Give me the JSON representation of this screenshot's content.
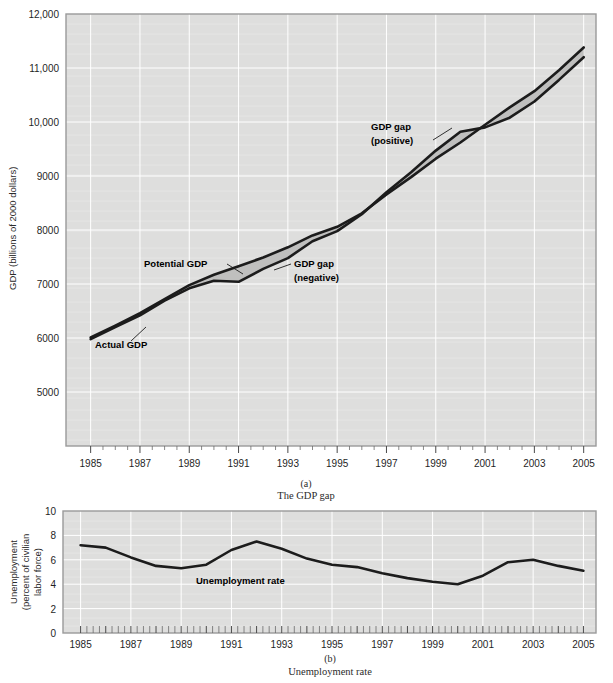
{
  "figure": {
    "panel_a": {
      "caption_letter": "(a)",
      "caption_text": "The GDP gap",
      "ylabel": "GDP (billions of 2000 dollars)",
      "annotations": {
        "actual": "Actual GDP",
        "potential": "Potential GDP",
        "gap_negative_line1": "GDP gap",
        "gap_negative_line2": "(negative)",
        "gap_positive_line1": "GDP gap",
        "gap_positive_line2": "(positive)"
      }
    },
    "panel_b": {
      "caption_letter": "(b)",
      "caption_text": "Unemployment rate",
      "ylabel_line1": "Unemployment",
      "ylabel_line2": "(percent of civilian",
      "ylabel_line3": "labor force)",
      "annotations": {
        "series": "Unemployment rate"
      }
    },
    "colors": {
      "plot_background": "#dededd",
      "gridline": "#ffffff",
      "series_line": "#1c1c1c",
      "gap_fill": "#bfbfbe",
      "border": "#9a9a9a"
    }
  },
  "chart_data": [
    {
      "type": "area",
      "title": "The GDP gap",
      "xlabel": "",
      "ylabel": "GDP (billions of 2000 dollars)",
      "xlim": [
        1984.0,
        2005.5
      ],
      "ylim": [
        4000,
        12000
      ],
      "ytick_labels": [
        "12,000",
        "11,000",
        "10,000",
        "9000",
        "8000",
        "7000",
        "6000",
        "5000"
      ],
      "yticks": [
        12000,
        11000,
        10000,
        9000,
        8000,
        7000,
        6000,
        5000
      ],
      "xticks": [
        1985,
        1987,
        1989,
        1991,
        1993,
        1995,
        1997,
        1999,
        2001,
        2003,
        2005
      ],
      "xtick_labels": [
        "1985",
        "1987",
        "1989",
        "1991",
        "1993",
        "1995",
        "1997",
        "1999",
        "2001",
        "2003",
        "2005"
      ],
      "grid": true,
      "legend_position": "inline-annotations",
      "x": [
        1985,
        1986,
        1987,
        1988,
        1989,
        1990,
        1991,
        1992,
        1993,
        1994,
        1995,
        1996,
        1997,
        1998,
        1999,
        2000,
        2001,
        2002,
        2003,
        2004,
        2005
      ],
      "series": [
        {
          "name": "Actual GDP",
          "values": [
            5980,
            6200,
            6420,
            6690,
            6920,
            7060,
            7040,
            7280,
            7480,
            7790,
            7980,
            8290,
            8700,
            9070,
            9470,
            9820,
            9900,
            10080,
            10380,
            10780,
            11200
          ]
        },
        {
          "name": "Potential GDP",
          "values": [
            6010,
            6230,
            6460,
            6720,
            6980,
            7170,
            7330,
            7490,
            7680,
            7900,
            8060,
            8310,
            8660,
            8980,
            9320,
            9620,
            9950,
            10270,
            10570,
            10960,
            11380
          ]
        }
      ],
      "shaded_regions": [
        {
          "label": "GDP gap (negative)",
          "start": 1989,
          "end": 1996,
          "meaning": "actual below potential"
        },
        {
          "label": "GDP gap (positive)",
          "start": 1996,
          "end": 2001,
          "meaning": "actual above potential"
        },
        {
          "label": "GDP gap (negative)",
          "start": 2001,
          "end": 2005,
          "meaning": "actual below potential"
        }
      ]
    },
    {
      "type": "line",
      "title": "Unemployment rate",
      "xlabel": "",
      "ylabel": "Unemployment (percent of civilian labor force)",
      "xlim": [
        1984.3,
        2005.5
      ],
      "ylim": [
        0,
        10
      ],
      "yticks": [
        0,
        2,
        4,
        6,
        8,
        10
      ],
      "ytick_labels": [
        "0",
        "2",
        "4",
        "6",
        "8",
        "10"
      ],
      "xticks": [
        1985,
        1987,
        1989,
        1991,
        1993,
        1995,
        1997,
        1999,
        2001,
        2003,
        2005
      ],
      "xtick_labels": [
        "1985",
        "1987",
        "1989",
        "1991",
        "1993",
        "1995",
        "1997",
        "1999",
        "2001",
        "2003",
        "2005"
      ],
      "grid": true,
      "x": [
        1985,
        1986,
        1987,
        1988,
        1989,
        1990,
        1991,
        1992,
        1993,
        1994,
        1995,
        1996,
        1997,
        1998,
        1999,
        2000,
        2001,
        2002,
        2003,
        2004,
        2005
      ],
      "series": [
        {
          "name": "Unemployment rate",
          "values": [
            7.2,
            7.0,
            6.2,
            5.5,
            5.3,
            5.6,
            6.8,
            7.5,
            6.9,
            6.1,
            5.6,
            5.4,
            4.9,
            4.5,
            4.2,
            4.0,
            4.7,
            5.8,
            6.0,
            5.5,
            5.1
          ]
        }
      ]
    }
  ]
}
